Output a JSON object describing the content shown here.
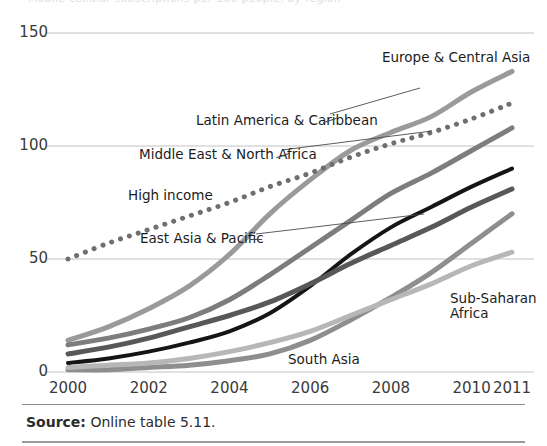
{
  "figure": {
    "cut_off_header": "Mobile cellular subscriptions per 100 people, by region",
    "source_prefix": "Source:",
    "source_text": "Online table 5.11."
  },
  "chart_data": {
    "type": "line",
    "title": "",
    "xlabel": "",
    "ylabel": "",
    "x": [
      2000,
      2001,
      2002,
      2003,
      2004,
      2005,
      2006,
      2007,
      2008,
      2009,
      2010,
      2011
    ],
    "xtick_labels": [
      "2000",
      "2002",
      "2004",
      "2006",
      "2008",
      "2010",
      "2011"
    ],
    "xticks": [
      2000,
      2002,
      2004,
      2006,
      2008,
      2010,
      2011
    ],
    "ytick_labels": [
      "0",
      "50",
      "100",
      "150"
    ],
    "yticks": [
      0,
      50,
      100,
      150
    ],
    "ylim": [
      0,
      150
    ],
    "xlim": [
      2000,
      2011
    ],
    "grid": "horizontal",
    "legend": "inline-annotations",
    "series": [
      {
        "name": "Europe & Central Asia",
        "color": "#9a9a9a",
        "style": "solid",
        "width": 5,
        "values": [
          14,
          20,
          28,
          38,
          52,
          70,
          85,
          98,
          106,
          113,
          124,
          133
        ]
      },
      {
        "name": "High income",
        "color": "#6f6f6f",
        "style": "dotted",
        "width": 5,
        "values": [
          50,
          57,
          63,
          69,
          75,
          82,
          88,
          95,
          101,
          106,
          112,
          119
        ]
      },
      {
        "name": "Latin America & Caribbean",
        "color": "#7d7d7d",
        "style": "solid",
        "width": 5,
        "values": [
          12,
          15,
          19,
          24,
          32,
          43,
          55,
          67,
          79,
          88,
          98,
          108
        ]
      },
      {
        "name": "Middle East & North Africa",
        "color": "#151515",
        "style": "solid",
        "width": 4,
        "values": [
          4,
          6,
          9,
          13,
          18,
          26,
          38,
          52,
          64,
          73,
          82,
          90
        ]
      },
      {
        "name": "East Asia & Pacific",
        "color": "#585858",
        "style": "solid",
        "width": 5,
        "values": [
          8,
          11,
          15,
          20,
          25,
          31,
          39,
          48,
          56,
          64,
          73,
          81
        ]
      },
      {
        "name": "South Asia",
        "color": "#8e8e8e",
        "style": "solid",
        "width": 5,
        "values": [
          1,
          1,
          2,
          3,
          5,
          8,
          14,
          23,
          33,
          44,
          57,
          70
        ]
      },
      {
        "name": "Sub-Saharan Africa",
        "color": "#b7b7b7",
        "style": "solid",
        "width": 5,
        "values": [
          2,
          3,
          4,
          6,
          9,
          13,
          18,
          25,
          32,
          39,
          47,
          53
        ]
      }
    ],
    "annotations": [
      {
        "label": "Europe & Central Asia",
        "x": 382,
        "y": 50
      },
      {
        "label": "Latin America & Caribbean",
        "x": 196,
        "y": 113
      },
      {
        "label": "Middle East & North Africa",
        "x": 139,
        "y": 147
      },
      {
        "label": "High income",
        "x": 128,
        "y": 188
      },
      {
        "label": "East Asia & Pacific",
        "x": 140,
        "y": 231
      },
      {
        "label": "Sub-Saharan Africa",
        "x": 450,
        "y": 291
      },
      {
        "label": "South Asia",
        "x": 288,
        "y": 352
      }
    ]
  }
}
